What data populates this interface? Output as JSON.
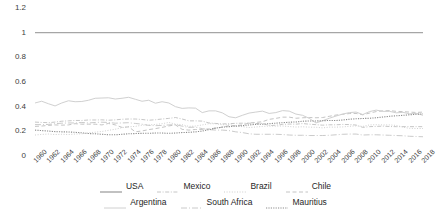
{
  "chart_data": {
    "type": "line",
    "title": "",
    "subtitle": "",
    "xlabel": "",
    "ylabel": "",
    "ylim": [
      0,
      1.2
    ],
    "yticks": [
      0,
      0.2,
      0.4,
      0.6,
      0.8,
      1,
      1.2
    ],
    "ytick_labels": [
      "0",
      "0.2",
      "0.4",
      "0.6",
      "0.8",
      "1",
      "1.2"
    ],
    "grid": false,
    "legend_position": "bottom",
    "xlim": [
      1960,
      2018
    ],
    "x": [
      1960,
      1961,
      1962,
      1963,
      1964,
      1965,
      1966,
      1967,
      1968,
      1969,
      1970,
      1971,
      1972,
      1973,
      1974,
      1975,
      1976,
      1977,
      1978,
      1979,
      1980,
      1981,
      1982,
      1983,
      1984,
      1985,
      1986,
      1987,
      1988,
      1989,
      1990,
      1991,
      1992,
      1993,
      1994,
      1995,
      1996,
      1997,
      1998,
      1999,
      2000,
      2001,
      2002,
      2003,
      2004,
      2005,
      2006,
      2007,
      2008,
      2009,
      2010,
      2011,
      2012,
      2013,
      2014,
      2015,
      2016,
      2017,
      2018
    ],
    "xtick_labels": [
      "1960",
      "1962",
      "1964",
      "1966",
      "1968",
      "1970",
      "1972",
      "1974",
      "1976",
      "1978",
      "1980",
      "1982",
      "1984",
      "1986",
      "1988",
      "1990",
      "1992",
      "1994",
      "1996",
      "1998",
      "2000",
      "2002",
      "2004",
      "2006",
      "2008",
      "2010",
      "2012",
      "2014",
      "2016",
      "2018"
    ],
    "series": [
      {
        "name": "USA",
        "style": "solid",
        "color": "#a6a6a6",
        "width": 1.4,
        "values": [
          1,
          1,
          1,
          1,
          1,
          1,
          1,
          1,
          1,
          1,
          1,
          1,
          1,
          1,
          1,
          1,
          1,
          1,
          1,
          1,
          1,
          1,
          1,
          1,
          1,
          1,
          1,
          1,
          1,
          1,
          1,
          1,
          1,
          1,
          1,
          1,
          1,
          1,
          1,
          1,
          1,
          1,
          1,
          1,
          1,
          1,
          1,
          1,
          1,
          1,
          1,
          1,
          1,
          1,
          1,
          1,
          1,
          1,
          1
        ]
      },
      {
        "name": "Mexico",
        "style": "dash-dot",
        "color": "#bfbfbf",
        "width": 0.9,
        "values": [
          0.275,
          0.272,
          0.27,
          0.275,
          0.282,
          0.285,
          0.288,
          0.288,
          0.292,
          0.292,
          0.293,
          0.29,
          0.293,
          0.298,
          0.3,
          0.3,
          0.296,
          0.29,
          0.294,
          0.3,
          0.305,
          0.312,
          0.3,
          0.285,
          0.285,
          0.283,
          0.268,
          0.264,
          0.26,
          0.262,
          0.265,
          0.266,
          0.266,
          0.263,
          0.265,
          0.246,
          0.25,
          0.256,
          0.259,
          0.258,
          0.263,
          0.258,
          0.254,
          0.25,
          0.253,
          0.253,
          0.256,
          0.255,
          0.251,
          0.232,
          0.238,
          0.24,
          0.242,
          0.239,
          0.238,
          0.238,
          0.238,
          0.238,
          0.238
        ]
      },
      {
        "name": "Brazil",
        "style": "fine-dot",
        "color": "#c9c9c9",
        "width": 0.9,
        "values": [
          0.17,
          0.175,
          0.178,
          0.174,
          0.176,
          0.174,
          0.178,
          0.18,
          0.188,
          0.193,
          0.199,
          0.208,
          0.217,
          0.23,
          0.237,
          0.24,
          0.25,
          0.252,
          0.256,
          0.262,
          0.272,
          0.258,
          0.254,
          0.24,
          0.243,
          0.252,
          0.262,
          0.261,
          0.253,
          0.256,
          0.242,
          0.238,
          0.231,
          0.235,
          0.24,
          0.243,
          0.242,
          0.243,
          0.239,
          0.235,
          0.237,
          0.234,
          0.233,
          0.228,
          0.234,
          0.234,
          0.236,
          0.241,
          0.244,
          0.24,
          0.252,
          0.254,
          0.252,
          0.252,
          0.248,
          0.234,
          0.224,
          0.223,
          0.223
        ]
      },
      {
        "name": "Chile",
        "style": "dash",
        "color": "#bdbdbd",
        "width": 0.9,
        "values": [
          0.24,
          0.243,
          0.248,
          0.252,
          0.25,
          0.252,
          0.262,
          0.258,
          0.258,
          0.258,
          0.252,
          0.264,
          0.252,
          0.232,
          0.236,
          0.196,
          0.203,
          0.214,
          0.222,
          0.232,
          0.244,
          0.252,
          0.216,
          0.21,
          0.215,
          0.214,
          0.22,
          0.226,
          0.234,
          0.246,
          0.246,
          0.252,
          0.268,
          0.272,
          0.278,
          0.297,
          0.305,
          0.315,
          0.315,
          0.306,
          0.31,
          0.312,
          0.31,
          0.312,
          0.322,
          0.332,
          0.338,
          0.344,
          0.345,
          0.334,
          0.348,
          0.36,
          0.366,
          0.368,
          0.362,
          0.36,
          0.356,
          0.353,
          0.356
        ]
      },
      {
        "name": "Argentina",
        "style": "solid-light",
        "color": "#d0d0d0",
        "width": 1.0,
        "values": [
          0.43,
          0.444,
          0.424,
          0.406,
          0.43,
          0.448,
          0.44,
          0.442,
          0.452,
          0.468,
          0.47,
          0.472,
          0.462,
          0.468,
          0.476,
          0.46,
          0.444,
          0.452,
          0.428,
          0.44,
          0.43,
          0.4,
          0.386,
          0.39,
          0.388,
          0.352,
          0.366,
          0.366,
          0.35,
          0.318,
          0.31,
          0.33,
          0.348,
          0.356,
          0.364,
          0.345,
          0.352,
          0.368,
          0.364,
          0.34,
          0.33,
          0.305,
          0.268,
          0.286,
          0.306,
          0.324,
          0.34,
          0.352,
          0.356,
          0.336,
          0.36,
          0.372,
          0.362,
          0.362,
          0.35,
          0.354,
          0.342,
          0.346,
          0.33
        ]
      },
      {
        "name": "South Africa",
        "style": "long-dash-dot",
        "color": "#c4c4c4",
        "width": 0.9,
        "values": [
          0.255,
          0.254,
          0.256,
          0.262,
          0.266,
          0.268,
          0.268,
          0.272,
          0.268,
          0.272,
          0.274,
          0.272,
          0.266,
          0.268,
          0.27,
          0.264,
          0.258,
          0.248,
          0.246,
          0.248,
          0.252,
          0.254,
          0.242,
          0.232,
          0.234,
          0.222,
          0.214,
          0.21,
          0.21,
          0.206,
          0.196,
          0.19,
          0.18,
          0.176,
          0.176,
          0.176,
          0.176,
          0.174,
          0.17,
          0.168,
          0.168,
          0.166,
          0.166,
          0.166,
          0.168,
          0.172,
          0.176,
          0.178,
          0.178,
          0.17,
          0.172,
          0.172,
          0.17,
          0.168,
          0.166,
          0.164,
          0.16,
          0.158,
          0.156
        ]
      },
      {
        "name": "Mauritius",
        "style": "dot",
        "color": "#8c8c8c",
        "width": 1.1,
        "values": [
          0.21,
          0.206,
          0.202,
          0.198,
          0.196,
          0.195,
          0.192,
          0.188,
          0.182,
          0.18,
          0.176,
          0.172,
          0.172,
          0.176,
          0.18,
          0.182,
          0.184,
          0.184,
          0.186,
          0.186,
          0.184,
          0.186,
          0.19,
          0.192,
          0.196,
          0.202,
          0.214,
          0.226,
          0.234,
          0.238,
          0.242,
          0.246,
          0.252,
          0.256,
          0.258,
          0.262,
          0.266,
          0.27,
          0.274,
          0.276,
          0.282,
          0.284,
          0.284,
          0.286,
          0.288,
          0.288,
          0.292,
          0.298,
          0.302,
          0.304,
          0.306,
          0.31,
          0.316,
          0.322,
          0.326,
          0.33,
          0.334,
          0.338,
          0.342
        ]
      }
    ]
  },
  "legend": {
    "rows": [
      [
        {
          "label": "USA",
          "series": "USA"
        },
        {
          "label": "Mexico",
          "series": "Mexico"
        },
        {
          "label": "Brazil",
          "series": "Brazil"
        },
        {
          "label": "Chile",
          "series": "Chile"
        }
      ],
      [
        {
          "label": "Argentina",
          "series": "Argentina"
        },
        {
          "label": "South Africa",
          "series": "South Africa"
        },
        {
          "label": "Mauritius",
          "series": "Mauritius"
        }
      ]
    ]
  }
}
